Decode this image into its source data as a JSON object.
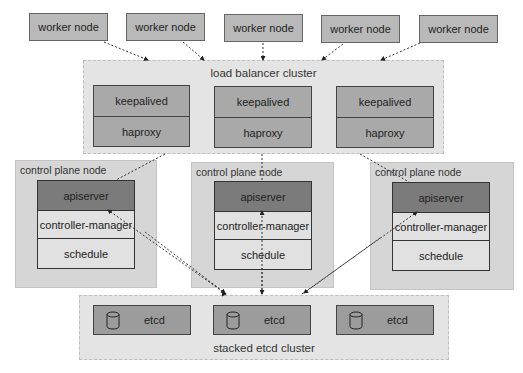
{
  "workers": [
    {
      "label": "worker node"
    },
    {
      "label": "worker node"
    },
    {
      "label": "worker node"
    },
    {
      "label": "worker node"
    },
    {
      "label": "worker node"
    }
  ],
  "load_balancer": {
    "title": "load balancer cluster",
    "units": [
      {
        "top": "keepalived",
        "bottom": "haproxy"
      },
      {
        "top": "keepalived",
        "bottom": "haproxy"
      },
      {
        "top": "keepalived",
        "bottom": "haproxy"
      }
    ]
  },
  "control_planes": [
    {
      "title": "control plane node",
      "components": [
        "apiserver",
        "controller-manager",
        "schedule"
      ]
    },
    {
      "title": "control plane node",
      "components": [
        "apiserver",
        "controller-manager",
        "schedule"
      ]
    },
    {
      "title": "control plane node",
      "components": [
        "apiserver",
        "controller-manager",
        "schedule"
      ]
    }
  ],
  "etcd_cluster": {
    "title": "stacked etcd cluster",
    "nodes": [
      {
        "label": "etcd",
        "icon": "database-icon"
      },
      {
        "label": "etcd",
        "icon": "database-icon"
      },
      {
        "label": "etcd",
        "icon": "database-icon"
      }
    ]
  },
  "colors": {
    "worker": "#b9b9b9",
    "cluster_bg": "#e4e4e4",
    "lb_box": "#a9a9a9",
    "control_plane_bg": "#d6d6d6",
    "apiserver": "#7b7b7b",
    "component_light": "#e1e1e1",
    "etcd_box": "#9c9c9c"
  }
}
